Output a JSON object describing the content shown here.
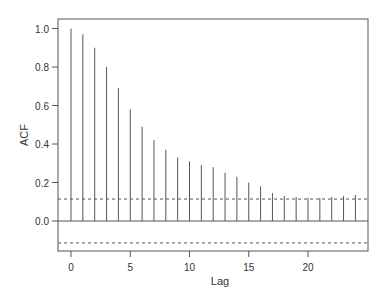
{
  "chart_data": {
    "type": "bar",
    "subtype": "acf-stem",
    "title": "",
    "xlabel": "Lag",
    "ylabel": "ACF",
    "x": [
      0,
      1,
      2,
      3,
      4,
      5,
      6,
      7,
      8,
      9,
      10,
      11,
      12,
      13,
      14,
      15,
      16,
      17,
      18,
      19,
      20,
      21,
      22,
      23,
      24
    ],
    "values": [
      1.0,
      0.97,
      0.9,
      0.8,
      0.69,
      0.58,
      0.49,
      0.42,
      0.37,
      0.33,
      0.31,
      0.29,
      0.28,
      0.25,
      0.23,
      0.2,
      0.18,
      0.145,
      0.13,
      0.125,
      0.12,
      0.12,
      0.125,
      0.13,
      0.135
    ],
    "confidence_bounds": [
      0.114,
      -0.114
    ],
    "xticks": [
      0,
      5,
      10,
      15,
      20
    ],
    "xtick_labels": [
      "0",
      "5",
      "10",
      "15",
      "20"
    ],
    "yticks": [
      0.0,
      0.2,
      0.4,
      0.6,
      0.8,
      1.0
    ],
    "ytick_labels": [
      "0.0",
      "0.2",
      "0.4",
      "0.6",
      "0.8",
      "1.0"
    ],
    "xlim": [
      -1,
      25
    ],
    "ylim": [
      -0.155,
      1.05
    ],
    "grid": false,
    "legend": null
  },
  "colors": {
    "axis": "#555555",
    "stem": "#555555",
    "bound": "#555555"
  }
}
